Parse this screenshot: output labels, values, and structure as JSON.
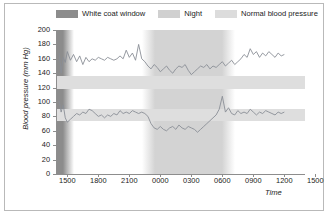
{
  "legend": {
    "items": [
      {
        "label": "White coat window",
        "color": "#8c8c8c",
        "name": "white-coat-window"
      },
      {
        "label": "Night",
        "color": "#d0d0d0",
        "name": "night"
      },
      {
        "label": "Normal blood pressure",
        "color": "#dcdcdc",
        "name": "normal-blood-pressure"
      }
    ]
  },
  "chart_data": {
    "type": "line",
    "title": "",
    "xlabel": "Time",
    "ylabel": "Blood pressure (mm Hg)",
    "ylim": [
      0,
      200
    ],
    "yticks": [
      0,
      20,
      40,
      60,
      80,
      100,
      120,
      140,
      160,
      180,
      200
    ],
    "xtick_labels": [
      "1500",
      "1800",
      "2100",
      "0000",
      "0300",
      "0600",
      "0900",
      "1200",
      "1500"
    ],
    "xlim_hours": [
      14.0,
      38.0
    ],
    "grid": false,
    "legend_position": "top",
    "bands": {
      "white_coat_window": {
        "start_hour": 14.0,
        "end_hour": 15.6,
        "color": "#8c8c8c"
      },
      "night": {
        "start_hour": 22.2,
        "end_hour": 31.2,
        "color": "#d3d3d3"
      },
      "normal_systolic": {
        "low": 118,
        "high": 136,
        "color": "#dedede"
      },
      "normal_diastolic": {
        "low": 74,
        "high": 90,
        "color": "#dedede"
      }
    },
    "series": [
      {
        "name": "Systolic",
        "color": "#8a8f96",
        "x": [
          14.2,
          14.4,
          14.6,
          14.8,
          15.0,
          15.3,
          15.6,
          15.9,
          16.2,
          16.5,
          16.8,
          17.1,
          17.4,
          17.7,
          18.0,
          18.3,
          18.6,
          18.9,
          19.2,
          19.5,
          19.8,
          20.1,
          20.4,
          20.7,
          21.0,
          21.3,
          21.6,
          21.9,
          22.2,
          22.5,
          22.8,
          23.1,
          23.4,
          23.7,
          24.0,
          24.3,
          24.6,
          24.9,
          25.2,
          25.5,
          25.8,
          26.1,
          26.4,
          26.7,
          27.0,
          27.3,
          27.6,
          27.9,
          28.2,
          28.5,
          28.8,
          29.1,
          29.4,
          29.7,
          30.0,
          30.3,
          30.6,
          30.9,
          31.2,
          31.5,
          31.8,
          32.1,
          32.4,
          32.7,
          33.0,
          33.3,
          33.6,
          33.9,
          34.2,
          34.5,
          34.8,
          35.1,
          35.4,
          35.7,
          36.0
        ],
        "y": [
          168,
          140,
          162,
          155,
          170,
          158,
          166,
          156,
          164,
          152,
          162,
          156,
          160,
          158,
          162,
          160,
          158,
          162,
          160,
          158,
          160,
          164,
          160,
          172,
          162,
          168,
          158,
          180,
          160,
          156,
          150,
          146,
          152,
          148,
          142,
          146,
          150,
          144,
          140,
          146,
          150,
          148,
          152,
          144,
          138,
          142,
          146,
          150,
          148,
          152,
          146,
          150,
          148,
          152,
          156,
          150,
          154,
          158,
          152,
          156,
          160,
          166,
          162,
          174,
          166,
          170,
          162,
          168,
          164,
          170,
          166,
          162,
          168,
          164,
          166
        ]
      },
      {
        "name": "Diastolic",
        "color": "#8a8f96",
        "x": [
          14.2,
          14.4,
          14.6,
          14.8,
          15.0,
          15.3,
          15.6,
          15.9,
          16.2,
          16.5,
          16.8,
          17.1,
          17.4,
          17.7,
          18.0,
          18.3,
          18.6,
          18.9,
          19.2,
          19.5,
          19.8,
          20.1,
          20.4,
          20.7,
          21.0,
          21.3,
          21.6,
          21.9,
          22.2,
          22.5,
          22.8,
          23.1,
          23.4,
          23.7,
          24.0,
          24.3,
          24.6,
          24.9,
          25.2,
          25.5,
          25.8,
          26.1,
          26.4,
          26.7,
          27.0,
          27.3,
          27.6,
          27.9,
          28.2,
          28.5,
          28.8,
          29.1,
          29.4,
          29.7,
          30.0,
          30.3,
          30.6,
          30.9,
          31.2,
          31.5,
          31.8,
          32.1,
          32.4,
          32.7,
          33.0,
          33.3,
          33.6,
          33.9,
          34.2,
          34.5,
          34.8,
          35.1,
          35.4,
          35.7,
          36.0
        ],
        "y": [
          102,
          86,
          96,
          78,
          72,
          76,
          80,
          84,
          82,
          86,
          84,
          90,
          88,
          84,
          80,
          82,
          78,
          82,
          80,
          84,
          82,
          88,
          84,
          86,
          84,
          88,
          86,
          84,
          86,
          84,
          80,
          70,
          64,
          62,
          66,
          62,
          60,
          64,
          66,
          62,
          68,
          64,
          62,
          66,
          64,
          62,
          58,
          62,
          66,
          70,
          74,
          78,
          82,
          90,
          108,
          86,
          92,
          84,
          82,
          88,
          84,
          86,
          84,
          90,
          86,
          82,
          86,
          84,
          88,
          86,
          84,
          82,
          86,
          84,
          86
        ]
      }
    ]
  }
}
